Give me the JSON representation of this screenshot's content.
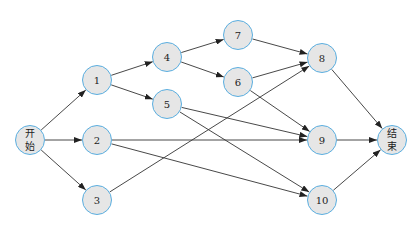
{
  "diagram": {
    "type": "network-flow",
    "line_color": "#333333",
    "node_border_color": "#5aaee0",
    "node_fill_color": "#e6e6e6",
    "nodes": [
      {
        "id": "start",
        "label": "开\n始",
        "label_top": "开",
        "label_bottom": "始",
        "x": 30,
        "y": 140
      },
      {
        "id": "1",
        "label": "1",
        "x": 97,
        "y": 80
      },
      {
        "id": "2",
        "label": "2",
        "x": 97,
        "y": 140
      },
      {
        "id": "3",
        "label": "3",
        "x": 97,
        "y": 200
      },
      {
        "id": "4",
        "label": "4",
        "x": 167,
        "y": 57
      },
      {
        "id": "5",
        "label": "5",
        "x": 167,
        "y": 104
      },
      {
        "id": "7",
        "label": "7",
        "x": 238,
        "y": 35
      },
      {
        "id": "6",
        "label": "6",
        "x": 238,
        "y": 82
      },
      {
        "id": "8",
        "label": "8",
        "x": 322,
        "y": 58
      },
      {
        "id": "9",
        "label": "9",
        "x": 322,
        "y": 140
      },
      {
        "id": "10",
        "label": "10",
        "x": 322,
        "y": 200
      },
      {
        "id": "end",
        "label": "结\n束",
        "label_top": "结",
        "label_bottom": "束",
        "x": 392,
        "y": 140
      }
    ],
    "edges": [
      [
        "start",
        "1"
      ],
      [
        "start",
        "2"
      ],
      [
        "start",
        "3"
      ],
      [
        "1",
        "4"
      ],
      [
        "1",
        "5"
      ],
      [
        "4",
        "7"
      ],
      [
        "4",
        "6"
      ],
      [
        "7",
        "8"
      ],
      [
        "6",
        "8"
      ],
      [
        "3",
        "8"
      ],
      [
        "6",
        "9"
      ],
      [
        "5",
        "9"
      ],
      [
        "2",
        "9"
      ],
      [
        "5",
        "10"
      ],
      [
        "2",
        "10"
      ],
      [
        "8",
        "end"
      ],
      [
        "9",
        "end"
      ],
      [
        "10",
        "end"
      ]
    ]
  }
}
